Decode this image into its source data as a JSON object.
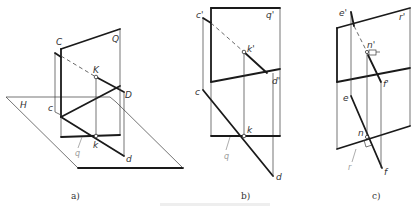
{
  "figures": {
    "a": {
      "caption": "a)",
      "labels": {
        "C": "C",
        "Q": "Q",
        "K": "K",
        "D": "D",
        "H": "H",
        "c": "c",
        "k": "k",
        "d": "d",
        "q": "q"
      }
    },
    "b": {
      "caption": "b)",
      "labels": {
        "c_prime": "c'",
        "q_prime": "q'",
        "k_prime": "k'",
        "d_prime": "d'",
        "c": "c",
        "k": "k",
        "d": "d",
        "q": "q"
      }
    },
    "c": {
      "caption": "c)",
      "labels": {
        "e_prime": "e'",
        "r_prime": "r'",
        "n_prime": "n'",
        "f_prime": "f'",
        "e": "e",
        "n": "n",
        "f": "f",
        "r": "r"
      }
    }
  },
  "colors": {
    "line": "#1a1a1a",
    "thin": "#3a3a3a",
    "grey": "#8a8a8a",
    "background": "#ffffff"
  }
}
